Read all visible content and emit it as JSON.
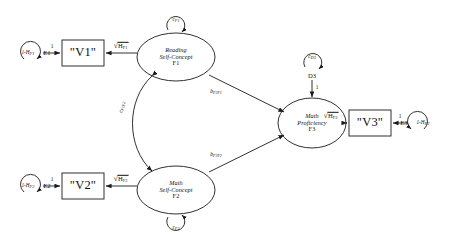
{
  "diagram": {
    "type": "structural-equation-model-path-diagram",
    "nodes": {
      "f1": {
        "line1": "Reading",
        "line2": "Self-Concept",
        "id": "F1"
      },
      "f2": {
        "line1": "Math",
        "line2": "Self-Concept",
        "id": "F2"
      },
      "f3": {
        "line1": "Math",
        "line2": "Proficiency",
        "id": "F3"
      },
      "v1": {
        "label": "\"V1\""
      },
      "v2": {
        "label": "\"V2\""
      },
      "v3": {
        "label": "\"V3\""
      },
      "e1": {
        "label": "E1",
        "variance_prefix": "1-H",
        "variance_sub": "F1"
      },
      "e2": {
        "label": "E2",
        "variance_prefix": "1-H",
        "variance_sub": "F2"
      },
      "e3": {
        "label": "E3",
        "variance_prefix": "1-H",
        "variance_sub": "F3"
      },
      "d3": {
        "label": "D3"
      }
    },
    "loops": {
      "c_f1": {
        "prefix": "c",
        "sub": "F1"
      },
      "c_f2": {
        "prefix": "c",
        "sub": "F2"
      },
      "c_d3": {
        "prefix": "c",
        "sub": "D3"
      }
    },
    "edges": {
      "e1_v1": {
        "label": "1"
      },
      "e2_v2": {
        "label": "1"
      },
      "e3_v3": {
        "label": "1"
      },
      "d3_f3": {
        "label": "1"
      },
      "f1_v1": {
        "radical": "√",
        "base": "H",
        "sub": "F1"
      },
      "f2_v2": {
        "radical": "√",
        "base": "H",
        "sub": "F2"
      },
      "f3_v3": {
        "radical": "√",
        "base": "H",
        "sub": "F3"
      },
      "f1_f3": {
        "base": "b",
        "sub": "F3F1"
      },
      "f2_f3": {
        "base": "b",
        "sub": "F3F2"
      },
      "f1_f2_cov": {
        "base": "c",
        "sub": "F1F2"
      }
    },
    "colors": {
      "stroke": "#1a1a1a",
      "background": "#ffffff",
      "text": "#111111"
    }
  }
}
